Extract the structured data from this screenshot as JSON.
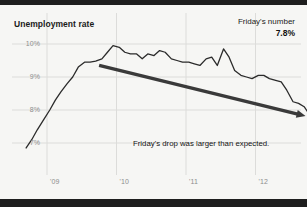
{
  "title": "Unemployment rate",
  "callout": {
    "label": "Friday's number",
    "value": "7.8%"
  },
  "annotation": "Friday's drop was larger than expected.",
  "colors": {
    "line": "#2b2b2b",
    "arrow": "#3a3a3a",
    "grid": "#dcdcda",
    "background": "#f6f6f4",
    "border": "#1e1e1e",
    "tick_text": "#8d8d8d"
  },
  "axis": {
    "y_ticks": [
      "10%",
      "9%",
      "8%",
      "7%"
    ],
    "x_ticks": [
      "'09",
      "'10",
      "'11",
      "'12"
    ]
  },
  "chart_data": {
    "type": "line",
    "title": "Unemployment rate",
    "xlabel": "",
    "ylabel": "",
    "ylim": [
      6.6,
      10.3
    ],
    "xlim": [
      2008.6,
      2012.85
    ],
    "grid": true,
    "legend": false,
    "y_tick_values": [
      10,
      9,
      8,
      7
    ],
    "y_tick_labels": [
      "10%",
      "9%",
      "8%",
      "7%"
    ],
    "x_tick_values": [
      2009,
      2010,
      2011,
      2012
    ],
    "x_tick_labels": [
      "'09",
      "'10",
      "'11",
      "'12"
    ],
    "annotations": [
      {
        "text": "Friday's drop was larger than expected.",
        "x": 2011.3,
        "y": 7.35
      },
      {
        "text": "Friday's number",
        "x": 2012.7,
        "y": 10.25
      },
      {
        "text": "7.8%",
        "x": 2012.7,
        "y": 10.0
      }
    ],
    "arrow": {
      "x_start": 2009.75,
      "y_start": 9.35,
      "x_end": 2012.72,
      "y_end": 7.82,
      "style": "solid-thick-arrowhead"
    },
    "end_marker": {
      "x": 2012.8,
      "y": 7.8,
      "label": "7.8%"
    },
    "series": [
      {
        "name": "Unemployment rate",
        "x": [
          2008.7,
          2008.78,
          2008.86,
          2008.95,
          2009.04,
          2009.12,
          2009.2,
          2009.29,
          2009.37,
          2009.45,
          2009.54,
          2009.62,
          2009.7,
          2009.79,
          2009.87,
          2009.95,
          2010.04,
          2010.12,
          2010.2,
          2010.29,
          2010.37,
          2010.45,
          2010.54,
          2010.62,
          2010.7,
          2010.79,
          2010.87,
          2010.95,
          2011.04,
          2011.12,
          2011.2,
          2011.29,
          2011.37,
          2011.45,
          2011.54,
          2011.62,
          2011.7,
          2011.79,
          2011.87,
          2011.95,
          2012.04,
          2012.12,
          2012.2,
          2012.29,
          2012.37,
          2012.45,
          2012.54,
          2012.62,
          2012.7,
          2012.8
        ],
        "values": [
          6.85,
          7.1,
          7.4,
          7.7,
          8.0,
          8.3,
          8.55,
          8.8,
          9.0,
          9.3,
          9.45,
          9.45,
          9.48,
          9.55,
          9.75,
          9.95,
          9.9,
          9.75,
          9.7,
          9.7,
          9.55,
          9.7,
          9.65,
          9.8,
          9.75,
          9.55,
          9.5,
          9.45,
          9.45,
          9.4,
          9.35,
          9.55,
          9.6,
          9.35,
          9.85,
          9.6,
          9.2,
          9.05,
          9.0,
          8.95,
          9.05,
          9.05,
          8.95,
          8.9,
          8.85,
          8.6,
          8.25,
          8.2,
          8.1,
          7.8
        ]
      }
    ]
  }
}
